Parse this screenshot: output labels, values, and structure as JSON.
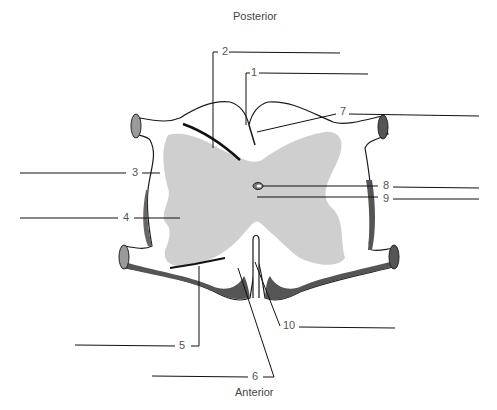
{
  "diagram": {
    "title_top": "Posterior",
    "title_bottom": "Anterior",
    "labels": [
      {
        "n": "1",
        "x": 250,
        "y": 72
      },
      {
        "n": "2",
        "x": 223,
        "y": 51
      },
      {
        "n": "3",
        "x": 132,
        "y": 173
      },
      {
        "n": "4",
        "x": 124,
        "y": 218
      },
      {
        "n": "5",
        "x": 180,
        "y": 347
      },
      {
        "n": "6",
        "x": 253,
        "y": 378
      },
      {
        "n": "7",
        "x": 340,
        "y": 112
      },
      {
        "n": "8",
        "x": 384,
        "y": 185
      },
      {
        "n": "9",
        "x": 384,
        "y": 198
      },
      {
        "n": "10",
        "x": 283,
        "y": 326
      }
    ],
    "colors": {
      "gray_matter": "#cfcfcf",
      "outline": "#1a1a1a",
      "dark_band": "#555555",
      "root_fill": "#9a9a9a"
    },
    "caption": ""
  }
}
